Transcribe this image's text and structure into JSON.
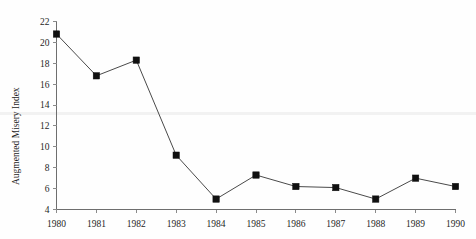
{
  "chart_data": {
    "type": "line",
    "title": "",
    "subtitle": "",
    "xlabel": "",
    "ylabel": "Augmented Misery Index",
    "categories": [
      "1980",
      "1981",
      "1982",
      "1983",
      "1984",
      "1985",
      "1986",
      "1987",
      "1988",
      "1989",
      "1990"
    ],
    "x": [
      1980,
      1981,
      1982,
      1983,
      1984,
      1985,
      1986,
      1987,
      1988,
      1989,
      1990
    ],
    "values": [
      20.8,
      16.8,
      18.3,
      9.2,
      5.0,
      7.3,
      6.2,
      6.1,
      5.0,
      7.0,
      6.2
    ],
    "series": [
      {
        "name": "Augmented Misery Index",
        "values": [
          20.8,
          16.8,
          18.3,
          9.2,
          5.0,
          7.3,
          6.2,
          6.1,
          5.0,
          7.0,
          6.2
        ]
      }
    ],
    "xlim": [
      1980,
      1990
    ],
    "ylim": [
      4,
      22
    ],
    "ytick_labels": [
      "4",
      "6",
      "8",
      "10",
      "12",
      "14",
      "16",
      "18",
      "20",
      "22"
    ],
    "yticks": [
      4,
      6,
      8,
      10,
      12,
      14,
      16,
      18,
      20,
      22
    ],
    "xtick_labels": [
      "1980",
      "1981",
      "1982",
      "1983",
      "1984",
      "1985",
      "1986",
      "1987",
      "1988",
      "1989",
      "1990"
    ],
    "xticks": [
      1980,
      1981,
      1982,
      1983,
      1984,
      1985,
      1986,
      1987,
      1988,
      1989,
      1990
    ],
    "grid": false,
    "legend": false,
    "legend_position": "none",
    "marker": "square",
    "marker_color": "#101010",
    "line_color": "#4a4a4a",
    "background_color": "#fefefe",
    "axis_color": "#6e6e6e"
  }
}
